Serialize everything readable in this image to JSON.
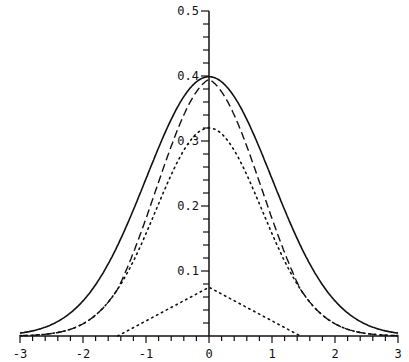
{
  "chart_data": {
    "type": "line",
    "title": "",
    "xlabel": "",
    "ylabel": "",
    "xlim": [
      -3,
      3
    ],
    "ylim": [
      0,
      0.5
    ],
    "grid": false,
    "legend": null,
    "x_ticks": [
      -3,
      -2,
      -1,
      0,
      1,
      2,
      3
    ],
    "x_tick_labels": [
      "-3",
      "-2",
      "-1",
      "0",
      "1",
      "2",
      "3"
    ],
    "x_minor_step": 0.2,
    "y_ticks": [
      0.1,
      0.2,
      0.3,
      0.4,
      0.5
    ],
    "y_tick_labels": [
      "0.1",
      "0.2",
      "0.3",
      "0.4",
      "0.5"
    ],
    "y_minor_step": 0.02,
    "series": [
      {
        "name": "target density (solid)",
        "style": "solid",
        "description": "standard normal density N(0,1)",
        "x": [
          -3,
          -2.5,
          -2,
          -1.5,
          -1,
          -0.5,
          0,
          0.5,
          1,
          1.5,
          2,
          2.5,
          3
        ],
        "y": [
          0.004,
          0.018,
          0.054,
          0.13,
          0.242,
          0.352,
          0.399,
          0.352,
          0.242,
          0.13,
          0.054,
          0.018,
          0.004
        ]
      },
      {
        "name": "approximation (dashed)",
        "style": "dashed",
        "description": "sum of the two dotted components",
        "x": [
          -3,
          -2.5,
          -2,
          -1.5,
          -1,
          -0.5,
          0,
          0.5,
          1,
          1.5,
          2,
          2.5,
          3
        ],
        "y": [
          0.002,
          0.013,
          0.047,
          0.125,
          0.245,
          0.358,
          0.395,
          0.358,
          0.245,
          0.125,
          0.047,
          0.013,
          0.002
        ]
      },
      {
        "name": "normal component (dotted)",
        "style": "dotted",
        "x": [
          -3,
          -2.5,
          -2,
          -1.5,
          -1,
          -0.5,
          0,
          0.5,
          1,
          1.5,
          2,
          2.5,
          3
        ],
        "y": [
          0.002,
          0.013,
          0.047,
          0.123,
          0.219,
          0.292,
          0.32,
          0.292,
          0.219,
          0.123,
          0.047,
          0.013,
          0.002
        ]
      },
      {
        "name": "triangular component (dotted)",
        "style": "dotted",
        "x": [
          -1.45,
          0,
          1.45
        ],
        "y": [
          0,
          0.075,
          0
        ]
      }
    ]
  }
}
